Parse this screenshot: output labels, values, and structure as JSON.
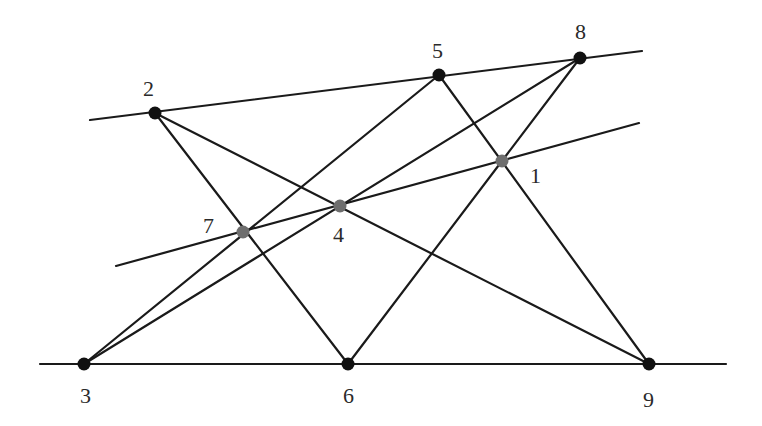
{
  "diagram": {
    "type": "point-line configuration",
    "colors": {
      "line": "#1a1a1a",
      "point_black": "#111111",
      "point_gray": "#6e6e6e",
      "label": "#2a2a2a"
    },
    "points": [
      {
        "id": "1",
        "label": "1",
        "x": 502,
        "y": 161,
        "color": "gray",
        "label_x": 530,
        "label_y": 183
      },
      {
        "id": "2",
        "label": "2",
        "x": 155,
        "y": 113,
        "color": "black",
        "label_x": 143,
        "label_y": 96
      },
      {
        "id": "3",
        "label": "3",
        "x": 84,
        "y": 364,
        "color": "black",
        "label_x": 80,
        "label_y": 403
      },
      {
        "id": "4",
        "label": "4",
        "x": 340,
        "y": 206,
        "color": "gray",
        "label_x": 333,
        "label_y": 242
      },
      {
        "id": "5",
        "label": "5",
        "x": 439,
        "y": 75,
        "color": "black",
        "label_x": 432,
        "label_y": 58
      },
      {
        "id": "6",
        "label": "6",
        "x": 348,
        "y": 364,
        "color": "black",
        "label_x": 343,
        "label_y": 403
      },
      {
        "id": "7",
        "label": "7",
        "x": 243,
        "y": 232,
        "color": "gray",
        "label_x": 203,
        "label_y": 233
      },
      {
        "id": "8",
        "label": "8",
        "x": 580,
        "y": 58,
        "color": "black",
        "label_x": 575,
        "label_y": 39
      },
      {
        "id": "9",
        "label": "9",
        "x": 649,
        "y": 364,
        "color": "black",
        "label_x": 643,
        "label_y": 407
      }
    ],
    "lines": [
      {
        "name": "line-2-5-8",
        "x1": 90,
        "y1": 120,
        "x2": 642,
        "y2": 51
      },
      {
        "name": "line-7-4-1",
        "x1": 116,
        "y1": 266,
        "x2": 639,
        "y2": 123
      },
      {
        "name": "line-3-6-9",
        "x1": 40,
        "y1": 364,
        "x2": 726,
        "y2": 364
      },
      {
        "name": "line-2-7-6",
        "x1": 155,
        "y1": 113,
        "x2": 348,
        "y2": 364
      },
      {
        "name": "line-2-4-9",
        "x1": 155,
        "y1": 113,
        "x2": 649,
        "y2": 364
      },
      {
        "name": "line-3-7-5",
        "x1": 84,
        "y1": 364,
        "x2": 439,
        "y2": 75
      },
      {
        "name": "line-3-4-8",
        "x1": 84,
        "y1": 364,
        "x2": 580,
        "y2": 58
      },
      {
        "name": "line-5-1-9",
        "x1": 439,
        "y1": 75,
        "x2": 649,
        "y2": 364
      },
      {
        "name": "line-6-1-8",
        "x1": 348,
        "y1": 364,
        "x2": 580,
        "y2": 58
      }
    ]
  }
}
